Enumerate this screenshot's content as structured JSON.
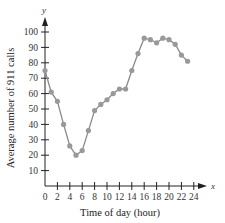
{
  "chart_data": {
    "type": "line",
    "title": "",
    "xlabel": "Time of day (hour)",
    "ylabel": "Average number of 911 calls",
    "x_axis_variable": "x",
    "y_axis_variable": "y",
    "x": [
      0,
      1,
      2,
      3,
      4,
      5,
      6,
      7,
      8,
      9,
      10,
      11,
      12,
      13,
      14,
      15,
      16,
      17,
      18,
      19,
      20,
      21,
      22,
      23
    ],
    "series": [
      {
        "name": "Average number of 911 calls",
        "values": [
          75,
          61,
          55,
          40,
          26,
          20,
          23,
          36,
          49,
          53,
          56,
          60,
          63,
          63,
          75,
          86,
          96,
          95,
          93,
          96,
          95,
          92,
          85,
          81
        ]
      }
    ],
    "x_ticks": [
      0,
      2,
      4,
      6,
      8,
      10,
      12,
      14,
      16,
      18,
      20,
      22,
      24
    ],
    "y_ticks": [
      10,
      20,
      30,
      40,
      50,
      60,
      70,
      80,
      90,
      100
    ],
    "xlim": [
      0,
      24
    ],
    "ylim": [
      0,
      100
    ],
    "grid": false,
    "legend": "none",
    "line_color": "#8a8a8a",
    "marker_color": "#999999",
    "axis_color": "#222222"
  }
}
